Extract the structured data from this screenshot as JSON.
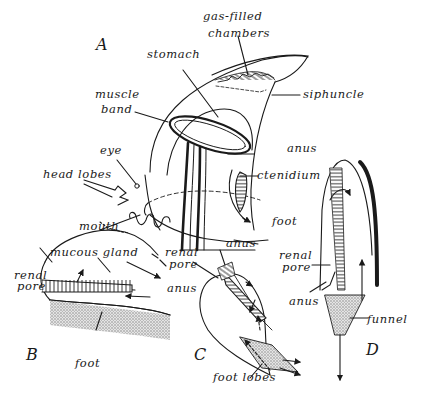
{
  "figure": {
    "panels": {
      "A": "A",
      "B": "B",
      "C": "C",
      "D": "D"
    },
    "panel_A_labels": {
      "gas_filled_chambers_1": "gas-filled",
      "gas_filled_chambers_2": "chambers",
      "stomach": "stomach",
      "siphuncle": "siphuncle",
      "muscle_band_1": "muscle",
      "muscle_band_2": "band",
      "eye": "eye",
      "anus": "anus",
      "head_lobes": "head lobes",
      "ctenidium": "ctenidium",
      "mouth": "mouth",
      "foot": "foot"
    },
    "panel_B_labels": {
      "mucous_gland": "mucous gland",
      "renal_pore_1": "renal",
      "renal_pore_2": "pore",
      "anus": "anus",
      "foot": "foot"
    },
    "panel_C_labels": {
      "anus": "anus",
      "renal_pore_1": "renal",
      "renal_pore_2": "pore",
      "foot_lobes": "foot lobes"
    },
    "panel_D_labels": {
      "renal_pore_1": "renal",
      "renal_pore_2": "pore",
      "anus": "anus",
      "funnel": "funnel"
    },
    "colors": {
      "ink": "#1a1a1a",
      "background": "#ffffff",
      "stipple": "#9a9a9a"
    }
  }
}
